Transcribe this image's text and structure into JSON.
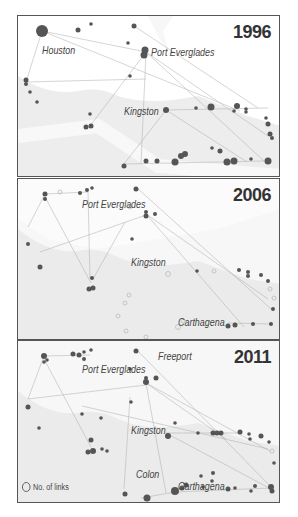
{
  "panels": [
    {
      "year": "1996",
      "labels": [
        {
          "text": "Houston",
          "x": 25,
          "y": 27
        },
        {
          "text": "Port Everglades",
          "x": 135,
          "y": 34
        },
        {
          "text": "Kingston",
          "x": 106,
          "y": 93
        }
      ]
    },
    {
      "year": "2006",
      "labels": [
        {
          "text": "Port Everglades",
          "x": 64,
          "y": 23
        },
        {
          "text": "Kingston",
          "x": 113,
          "y": 81
        },
        {
          "text": "Carthagena",
          "x": 160,
          "y": 139
        }
      ]
    },
    {
      "year": "2011",
      "labels": [
        {
          "text": "Freeport",
          "x": 140,
          "y": 13
        },
        {
          "text": "Port Everglades",
          "x": 64,
          "y": 26
        },
        {
          "text": "Kingston",
          "x": 113,
          "y": 87
        },
        {
          "text": "Colon",
          "x": 118,
          "y": 131
        },
        {
          "text": "Carthagena",
          "x": 160,
          "y": 142
        }
      ]
    }
  ],
  "legend": {
    "label": "No. of links"
  },
  "colors": {
    "node": "#555555",
    "land": "#e4e4e4",
    "link": "#bbbbbb",
    "border": "#555555"
  }
}
